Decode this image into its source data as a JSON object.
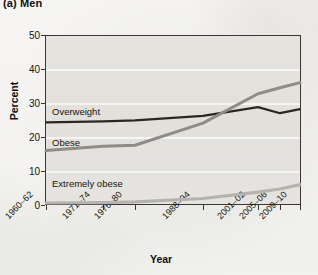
{
  "title": "(a) Men",
  "chart_data": {
    "type": "line",
    "title": "(a) Men",
    "xlabel": "Year",
    "ylabel": "Percent",
    "ylim": [
      0,
      50
    ],
    "yticks": [
      0,
      10,
      20,
      30,
      40,
      50
    ],
    "grid": true,
    "legend_position": "inline-labels",
    "categories": [
      "1960–62",
      "1971–74",
      "1976–80",
      "1988–94",
      "2001–02",
      "2005–06",
      "2009–10"
    ],
    "series": [
      {
        "name": "Overweight",
        "color": "#2a2722",
        "values": [
          24.3,
          24.6,
          24.9,
          26.2,
          28.8,
          27.0,
          28.2
        ]
      },
      {
        "name": "Obese",
        "color": "#8e8c86",
        "values": [
          16.0,
          17.3,
          17.6,
          24.1,
          32.7,
          34.5,
          36.0
        ]
      },
      {
        "name": "Extremely obese",
        "color": "#b5b3ad",
        "values": [
          0.6,
          0.7,
          0.9,
          1.9,
          3.8,
          4.7,
          6.0
        ]
      }
    ],
    "annotations": [
      {
        "text": "Overweight",
        "x": 1960,
        "y": 28.5
      },
      {
        "text": "Obese",
        "x": 1960,
        "y": 19.5
      },
      {
        "text": "Extremely obese",
        "x": 1960,
        "y": 6.5
      }
    ]
  },
  "axes": {
    "y_tick_labels": [
      "0",
      "10",
      "20",
      "30",
      "40",
      "50"
    ],
    "x_tick_labels": [
      "1960–62",
      "1971–74",
      "1976–80",
      "1988–94",
      "2001–02",
      "2005–06",
      "2009–10"
    ],
    "y_axis_title": "Percent",
    "x_axis_title": "Year"
  },
  "series_labels": {
    "overweight": "Overweight",
    "obese": "Obese",
    "extremely_obese": "Extremely obese"
  }
}
